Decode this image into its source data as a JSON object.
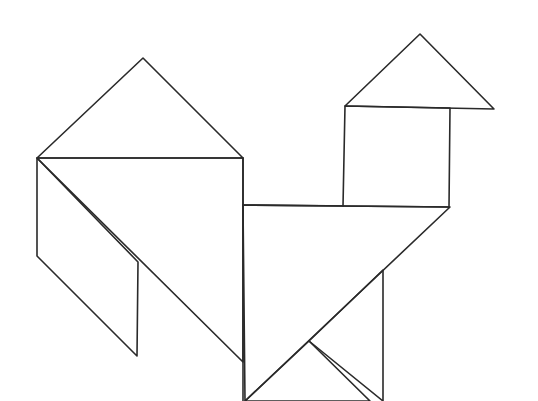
{
  "figure": {
    "background": "#ffffff",
    "line_color": "#2a2a2a",
    "pieces": [
      {
        "name": "head-triangle",
        "points": "420,34 345,106 494,109"
      },
      {
        "name": "neck-square",
        "points": "345,106 450,108 449,207 343,206"
      },
      {
        "name": "tail-large-triangle",
        "points": "143,58 37,158 243,158"
      },
      {
        "name": "tail-parallelogram",
        "points": "37,158 37,256 137,356 138,262"
      },
      {
        "name": "body-large-triangle",
        "points": "37,158 243,158 243,362"
      },
      {
        "name": "body-medium-triangle",
        "points": "243,205 450,207 245,401"
      },
      {
        "name": "leg-small-triangle",
        "points": "309,341 245,401 370,401"
      },
      {
        "name": "leg-right-triangle",
        "points": "383,270 383,401 309,341"
      }
    ],
    "extra_lines": [
      {
        "name": "body-vertical-edge",
        "x1": 243,
        "y1": 158,
        "y2": 401,
        "x2": 243
      },
      {
        "name": "body-top-edge",
        "x1": 243,
        "y1": 205,
        "x2": 343,
        "y2": 206
      }
    ]
  }
}
